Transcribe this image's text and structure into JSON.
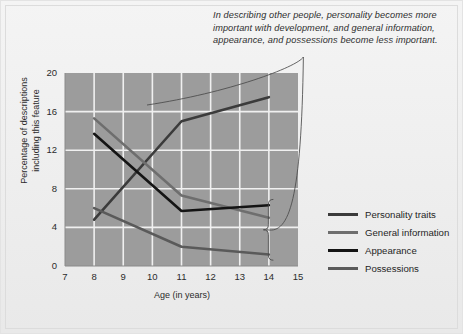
{
  "annotation": {
    "text": "In describing other people, personality becomes more important with development, and general information, appearance, and possessions become less important."
  },
  "chart_data": {
    "type": "line",
    "title": "",
    "xlabel": "Age (in years)",
    "ylabel": "Percentage of descriptions including this feature",
    "xlim": [
      7,
      15
    ],
    "ylim": [
      0,
      20
    ],
    "xticks": [
      "7",
      "8",
      "9",
      "10",
      "11",
      "12",
      "13",
      "14",
      "15"
    ],
    "yticks": [
      "0",
      "4",
      "8",
      "12",
      "16",
      "20"
    ],
    "grid": true,
    "legend_position": "right",
    "x": [
      8,
      11,
      14
    ],
    "series": [
      {
        "name": "Personality traits",
        "values": [
          4.8,
          15.0,
          17.5
        ],
        "color": "#3b3b3b"
      },
      {
        "name": "General information",
        "values": [
          15.3,
          7.3,
          5.0
        ],
        "color": "#6e6e6e"
      },
      {
        "name": "Appearance",
        "values": [
          13.7,
          5.7,
          6.3
        ],
        "color": "#141414"
      },
      {
        "name": "Possessions",
        "values": [
          6.0,
          2.0,
          1.2
        ],
        "color": "#5a5a5a"
      }
    ]
  },
  "colors": {
    "plot_background": "#9c9c9c",
    "grid": "#f0f0f0",
    "page_background": "#efefef",
    "text": "#2b2b2b"
  }
}
